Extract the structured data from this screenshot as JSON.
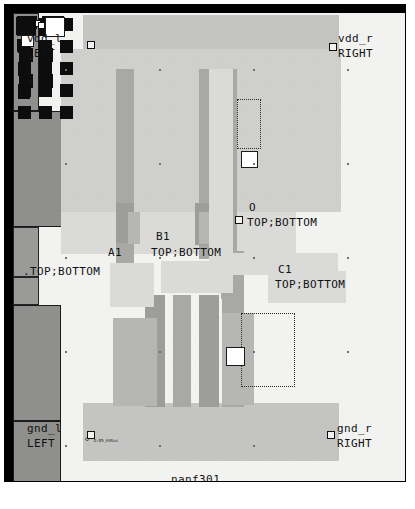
{
  "app": {
    "kind": "ic-layout-viewer",
    "cell_name": "nanf301"
  },
  "canvas": {
    "background_color": "#f2f2f1",
    "frame_color": "#000000",
    "grid_dot_color": "#9a9a99"
  },
  "labels": {
    "vdd_left": {
      "name": "vdd_l",
      "side": "LEFT"
    },
    "vdd_right": {
      "name": "vdd_r",
      "side": "RIGHT"
    },
    "gnd_left": {
      "name": "gnd_l",
      "side": "LEFT"
    },
    "gnd_right": {
      "name": "gnd_r",
      "side": "RIGHT"
    },
    "pin_o": {
      "name": "O",
      "layers": "TOP;BOTTOM"
    },
    "pin_a1": {
      "name": "A1",
      "layers": ".TOP;BOTTOM"
    },
    "pin_b1": {
      "name": "B1",
      "layers": "TOP;BOTTOM"
    },
    "pin_c1": {
      "name": "C1",
      "layers": "TOP;BOTTOM"
    },
    "cell_title": "nanf301",
    "net_flag": "D:B5_H4Sus"
  },
  "layer_colors": {
    "nwell": "#cfcfcd",
    "power_rail": "#c4c4c2",
    "diffusion": "#b6b6b4",
    "poly": "#a8a8a6",
    "metal": "#dadad8",
    "contact": "#0d0d0d",
    "contact_group": "#8f8f8d",
    "selected_via": "#ffffff"
  },
  "contact_groups": [
    {
      "id": "pmos-src-left",
      "cols": 1,
      "rows": 4
    },
    {
      "id": "pmos-mid-a",
      "cols": 3,
      "rows": 5
    },
    {
      "id": "pmos-out-col",
      "cols": 1,
      "rows": 4
    },
    {
      "id": "pmos-src-right",
      "cols": 2,
      "rows": 5
    },
    {
      "id": "nmos-left",
      "cols": 2,
      "rows": 3
    },
    {
      "id": "nmos-out",
      "cols": 1,
      "rows": 3
    }
  ]
}
